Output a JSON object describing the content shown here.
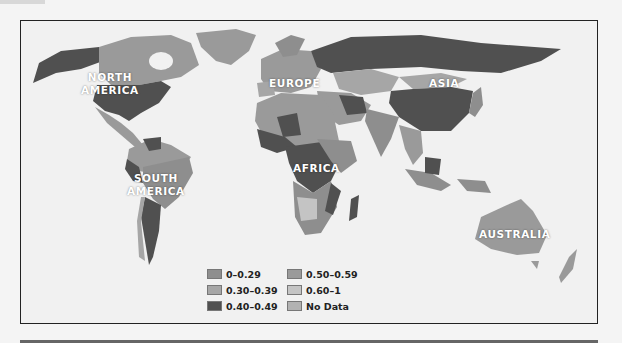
{
  "colors": {
    "c0_029": "#8e8e8e",
    "c030_039": "#a6a6a6",
    "c040_049": "#505050",
    "c050_059": "#9a9a9a",
    "c060_1": "#c4c4c4",
    "no_data": "#b2b2b2",
    "ocean": "#f1f1f1"
  },
  "regions": {
    "north_america": "NORTH\nAMERICA",
    "north_america_line1": "NORTH",
    "north_america_line2": "AMERICA",
    "south_america_line1": "SOUTH",
    "south_america_line2": "AMERICA",
    "europe": "EUROPE",
    "asia": "ASIA",
    "africa": "AFRICA",
    "australia": "AUSTRALIA"
  },
  "legend": {
    "items": [
      {
        "label": "0–0.29"
      },
      {
        "label": "0.30–0.39"
      },
      {
        "label": "0.40–0.49"
      },
      {
        "label": "0.50–0.59"
      },
      {
        "label": "0.60–1"
      },
      {
        "label": "No Data"
      }
    ]
  }
}
